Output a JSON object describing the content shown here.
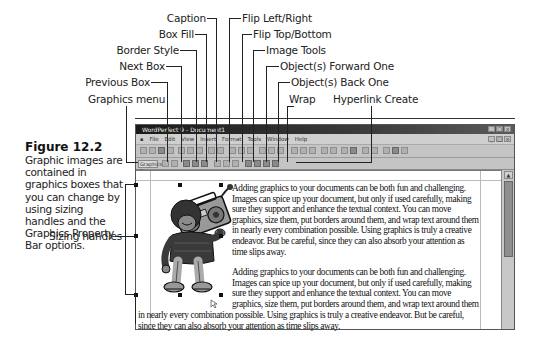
{
  "figure": {
    "title": "Figure 12.2",
    "description": "Graphic images are contained in graphics boxes that you can change by using sizing handles and the Graphics Property Bar options."
  },
  "callouts": {
    "left": [
      {
        "label": "Caption"
      },
      {
        "label": "Box Fill"
      },
      {
        "label": "Border Style"
      },
      {
        "label": "Next Box"
      },
      {
        "label": "Previous Box"
      },
      {
        "label": "Graphics menu"
      }
    ],
    "right": [
      {
        "label": "Flip Left/Right"
      },
      {
        "label": "Flip Top/Bottom"
      },
      {
        "label": "Image Tools"
      },
      {
        "label": "Object(s) Forward One"
      },
      {
        "label": "Object(s) Back One"
      },
      {
        "label": "Wrap"
      },
      {
        "label": "Hyperlink Create"
      }
    ],
    "sizing_handles": "Sizing handles"
  },
  "window": {
    "title": "WordPerfect 9 - Document1",
    "menu": [
      "File",
      "Edit",
      "View",
      "Insert",
      "Format",
      "Tools",
      "Window",
      "Help"
    ],
    "window_controls": [
      "_",
      "□",
      "×"
    ],
    "property_bar": {
      "graphics_menu_label": "Graphics ▾"
    },
    "scroll_up_glyph": "▲"
  },
  "document": {
    "paragraph1_lines": [
      "Adding graphics to your documents can be both fun and challenging.",
      "Images can spice up your document, but only if used carefully, making",
      "sure they support and enhance the textual context.  You can move",
      "graphics, size them, put borders around them, and wrap text around them",
      "in nearly every combination possible.  Using graphics is truly a creative",
      "endeavor.  But be careful, since they can also absorb your attention as",
      "time slips away."
    ],
    "paragraph2_lines_wrapped": [
      "Adding graphics to your documents can be both fun and challenging.",
      "Images can spice up your document, but only if used carefully, making",
      "sure they support and enhance the textual context.  You can move",
      "graphics, size them, put borders around them, and wrap text around them"
    ],
    "paragraph2_lines_full": [
      "in nearly every combination possible.  Using graphics is truly a creative endeavor.  But be careful,",
      "since they can also absorb your attention as time slips away."
    ]
  }
}
